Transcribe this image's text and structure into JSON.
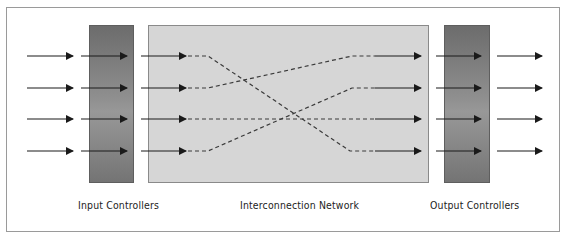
{
  "diagram": {
    "labels": {
      "input": "Input Controllers",
      "network": "Interconnection Network",
      "output": "Output Controllers"
    },
    "rows": 4,
    "connections": [
      {
        "from": 1,
        "to": 4
      },
      {
        "from": 2,
        "to": 1
      },
      {
        "from": 3,
        "to": 3
      },
      {
        "from": 4,
        "to": 2
      }
    ],
    "colors": {
      "controller_fill": "#7e7e7e",
      "network_fill": "#d6d6d6",
      "arrow": "#1a1a1a",
      "dashed_path": "#3a3a3a",
      "frame_border": "#9a9a9a"
    }
  }
}
